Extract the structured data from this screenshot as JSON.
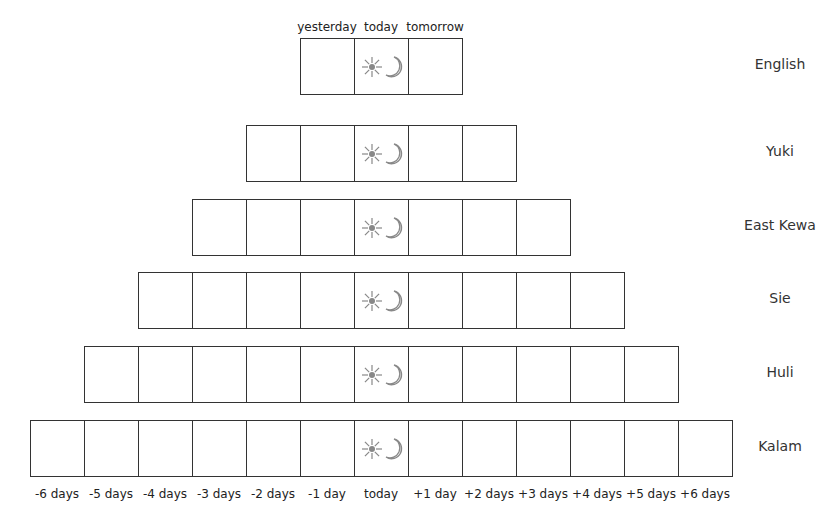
{
  "diagram": {
    "today_cell_icons": [
      "sun-icon",
      "moon-icon"
    ],
    "top_labels": [
      "yesterday",
      "today",
      "tomorrow"
    ],
    "bottom_labels": [
      "-6 days",
      "-5 days",
      "-4 days",
      "-3 days",
      "-2 days",
      "-1 day",
      "today",
      "+1 day",
      "+2 days",
      "+3 days",
      "+4 days",
      "+5 days",
      "+6 days"
    ],
    "languages": [
      {
        "name": "English",
        "days_before": 1,
        "days_after": 1
      },
      {
        "name": "Yuki",
        "days_before": 2,
        "days_after": 2
      },
      {
        "name": "East Kewa",
        "days_before": 3,
        "days_after": 3
      },
      {
        "name": "Sie",
        "days_before": 4,
        "days_after": 4
      },
      {
        "name": "Huli",
        "days_before": 5,
        "days_after": 5
      },
      {
        "name": "Kalam",
        "days_before": 6,
        "days_after": 6
      }
    ],
    "colors": {
      "line": "#333333",
      "icon": "#888888"
    }
  }
}
